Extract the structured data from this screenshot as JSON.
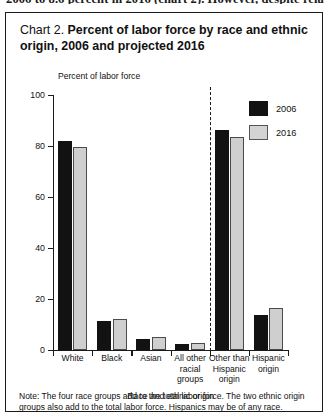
{
  "page": {
    "clipped_body_text": "2006 to 8.6 percent in 2016 (chart 2). However, despite rela"
  },
  "figure": {
    "title_prefix": "Chart 2.",
    "title_main": "Percent of labor force by race and ethnic origin, 2006 and projected 2016",
    "note": "Note: The four race groups add to the total labor force. The two ethnic origin groups also add to the total labor force. Hispanics may be of any race.",
    "legend_position": "top-right",
    "colors": {
      "series_2006": "#121212",
      "series_2016": "#cfcfcf",
      "axis": "#1a1a1a"
    }
  },
  "chart_data": {
    "type": "bar",
    "title": "Chart 2. Percent of labor force by race and ethnic origin, 2006 and projected 2016",
    "ylabel": "Percent of labor force",
    "xlabel": "Race and ethnic origin",
    "ylim": [
      0,
      100
    ],
    "yticks": [
      0,
      20,
      40,
      60,
      80,
      100
    ],
    "grid": false,
    "categories": [
      "White",
      "Black",
      "Asian",
      "All other racial groups",
      "Other than Hispanic origin",
      "Hispanic origin"
    ],
    "category_lines": [
      [
        "White"
      ],
      [
        "Black"
      ],
      [
        "Asian"
      ],
      [
        "All other",
        "racial",
        "groups"
      ],
      [
        "Other than",
        "Hispanic",
        "origin"
      ],
      [
        "Hispanic",
        "origin"
      ]
    ],
    "series": [
      {
        "name": "2006",
        "values": [
          82.0,
          11.4,
          4.4,
          2.2,
          86.2,
          13.7
        ]
      },
      {
        "name": "2016",
        "values": [
          79.6,
          12.3,
          5.3,
          2.8,
          83.6,
          16.4
        ]
      }
    ],
    "divider_after_category_index": 3,
    "divider_note": "dashed line separating race groups from ethnic origin groups"
  }
}
